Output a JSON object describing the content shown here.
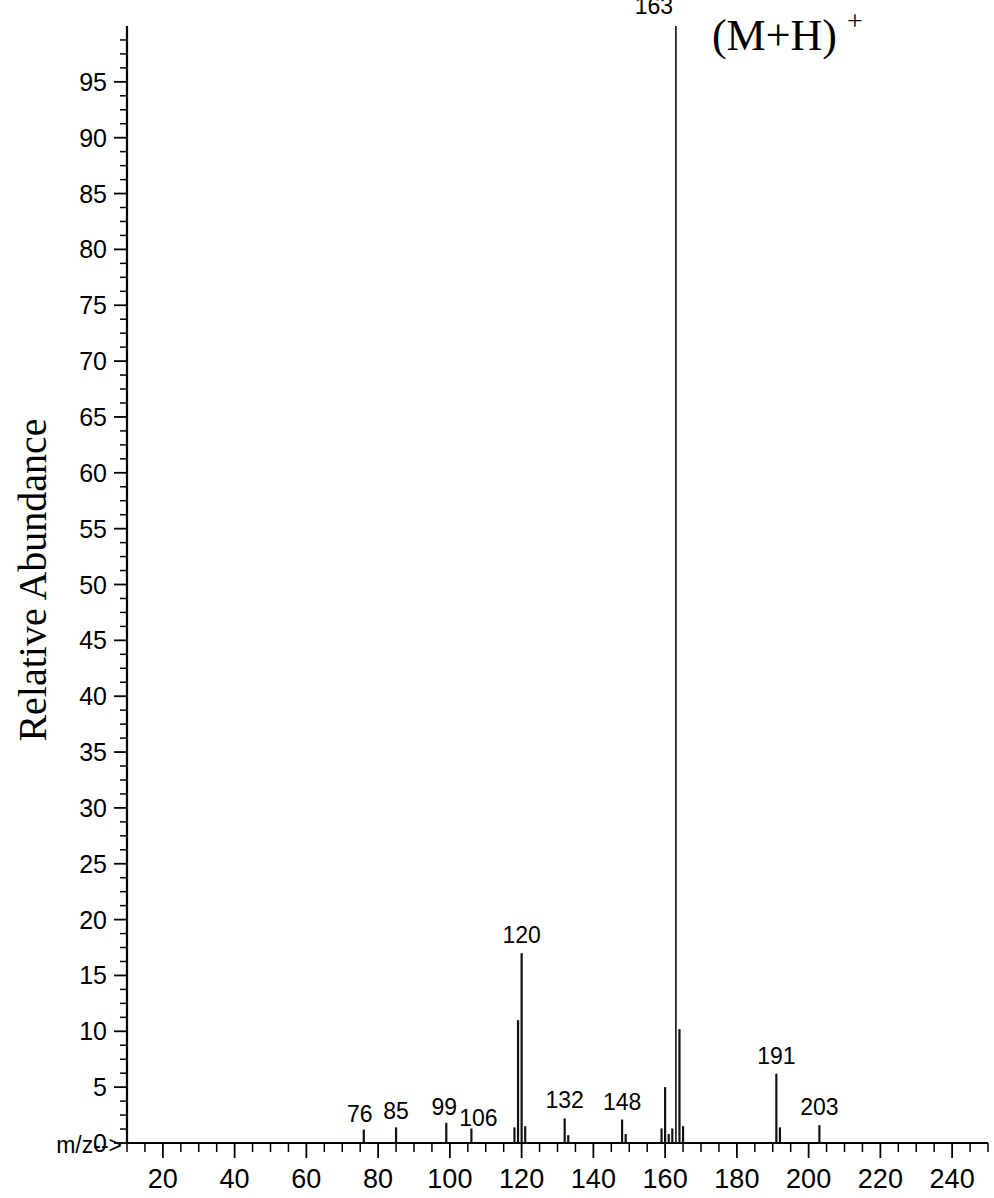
{
  "chart_data": {
    "type": "bar",
    "title": "",
    "subtitle": "",
    "xlabel": "m/z-->",
    "ylabel": "Relative Abundance",
    "xlim": [
      10,
      250
    ],
    "ylim": [
      0,
      100
    ],
    "grid": false,
    "legend": null,
    "x_major_ticks": [
      20,
      40,
      60,
      80,
      100,
      120,
      140,
      160,
      180,
      200,
      220,
      240
    ],
    "x_tick_labels": [
      "20",
      "40",
      "60",
      "80",
      "100",
      "120",
      "140",
      "160",
      "180",
      "200",
      "220",
      "240"
    ],
    "x_minor_tick_step": 5,
    "y_major_ticks": [
      0,
      5,
      10,
      15,
      20,
      25,
      30,
      35,
      40,
      45,
      50,
      55,
      60,
      65,
      70,
      75,
      80,
      85,
      90,
      95
    ],
    "y_tick_labels": [
      "0",
      "5",
      "10",
      "15",
      "20",
      "25",
      "30",
      "35",
      "40",
      "45",
      "50",
      "55",
      "60",
      "65",
      "70",
      "75",
      "80",
      "85",
      "90",
      "95"
    ],
    "y_minor_tick_step": 1.25,
    "x": [
      76,
      85,
      99,
      106,
      118,
      119,
      120,
      121,
      132,
      133,
      148,
      149,
      159,
      160,
      161,
      162,
      163,
      164,
      165,
      191,
      192,
      203
    ],
    "values": [
      1.2,
      1.4,
      1.8,
      1.3,
      1.4,
      11.0,
      17.0,
      1.5,
      2.2,
      0.7,
      2.1,
      0.8,
      1.3,
      5.0,
      0.8,
      1.3,
      100.0,
      10.2,
      1.5,
      6.2,
      1.4,
      1.6
    ],
    "labeled_peaks": [
      {
        "mz": 76,
        "label": "76",
        "intensity": 1.2
      },
      {
        "mz": 85,
        "label": "85",
        "intensity": 1.4
      },
      {
        "mz": 99,
        "label": "99",
        "intensity": 1.8
      },
      {
        "mz": 106,
        "label": "106",
        "intensity": 1.3
      },
      {
        "mz": 120,
        "label": "120",
        "intensity": 17.0
      },
      {
        "mz": 132,
        "label": "132",
        "intensity": 2.2
      },
      {
        "mz": 148,
        "label": "148",
        "intensity": 2.1
      },
      {
        "mz": 163,
        "label": "163",
        "intensity": 100.0
      },
      {
        "mz": 191,
        "label": "191",
        "intensity": 6.2
      },
      {
        "mz": 203,
        "label": "203",
        "intensity": 1.6
      }
    ],
    "annotations": [
      {
        "name": "molecular-ion-annotation",
        "base": "(M+H)",
        "superscript": "+",
        "near_mz": 163
      }
    ]
  },
  "axis": {
    "y_title": "Relative Abundance",
    "x_title": "m/z-->"
  }
}
